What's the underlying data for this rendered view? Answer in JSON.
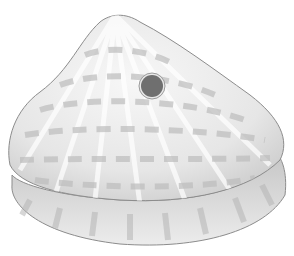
{
  "image": {
    "subject": "pencil drawing of a bivalve shell with a hole",
    "background": "#ffffff",
    "colors": {
      "shell_light": "#f2f2f2",
      "shell_mid": "#d6d6d6",
      "band": "#bdbdbd",
      "outline": "#8c8c8c",
      "hole": "#6f6f6f",
      "hole_rim": "#e8e8e8"
    }
  }
}
